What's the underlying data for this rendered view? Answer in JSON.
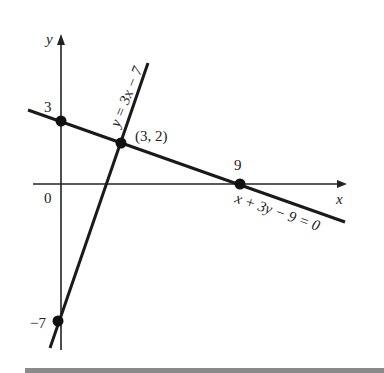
{
  "figure": {
    "axes": {
      "x_label": "x",
      "y_label": "y",
      "origin_label": "0"
    },
    "lines": [
      {
        "id": "line1",
        "equation": "x + 3y − 9 = 0"
      },
      {
        "id": "line2",
        "equation": "y = 3x − 7"
      }
    ],
    "points": [
      {
        "label": "3",
        "coords": [
          0,
          3
        ]
      },
      {
        "label": "(3, 2)",
        "coords": [
          3,
          2
        ]
      },
      {
        "label": "9",
        "coords": [
          9,
          0
        ]
      },
      {
        "label": "−7",
        "coords": [
          0,
          -7
        ]
      }
    ]
  }
}
